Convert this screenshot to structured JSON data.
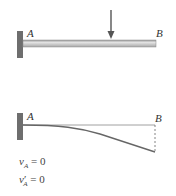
{
  "figure": {
    "top": {
      "description": "Cantilever beam fixed at A with concentrated downward load",
      "label_A": "A",
      "label_B": "B",
      "load": "downward-arrow"
    },
    "bottom": {
      "description": "Deflected shape of cantilever beam",
      "label_A": "A",
      "label_B": "B",
      "conditions": [
        {
          "var": "v",
          "prime": "",
          "sub": "A",
          "rest": " = 0"
        },
        {
          "var": "v",
          "prime": "′",
          "sub": "A",
          "rest": " = 0"
        }
      ]
    }
  },
  "colors": {
    "wall": "#707070",
    "beam_fill": "#c8c8c8",
    "beam_edge": "#7a7a7a",
    "arrow": "#555555",
    "curve": "#666666",
    "text": "#333333"
  }
}
